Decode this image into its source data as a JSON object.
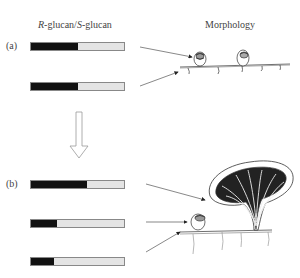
{
  "headers": {
    "left_r": "R",
    "left_mid": "-glucan/",
    "left_s": "S",
    "left_end": "-glucan",
    "right": "Morphology"
  },
  "panels": [
    {
      "label": "(a)",
      "bars": [
        {
          "r_fraction": 0.5
        },
        {
          "r_fraction": 0.51
        }
      ],
      "morphology": "two small cup-shaped primordia on mycelium"
    },
    {
      "label": "(b)",
      "bars": [
        {
          "r_fraction": 0.6
        },
        {
          "r_fraction": 0.28
        },
        {
          "r_fraction": 0.25
        }
      ],
      "morphology": "mature gilled fruit body, small primordium and mycelium"
    }
  ],
  "colors": {
    "r_glucan": "#111111",
    "s_glucan": "#e4e4e4"
  }
}
